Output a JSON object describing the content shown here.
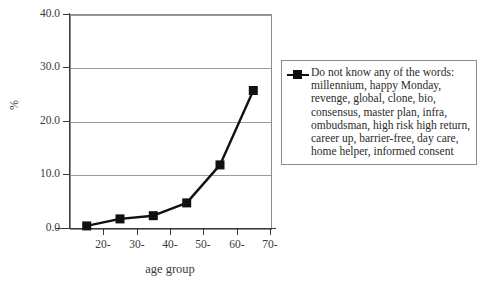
{
  "chart_data": {
    "type": "line",
    "title": "",
    "xlabel": "age group",
    "ylabel": "%",
    "xlim": [
      10,
      70
    ],
    "ylim": [
      0,
      40
    ],
    "grid": true,
    "legend_position": "right",
    "x_ticks": [
      "20-",
      "30-",
      "40-",
      "50-",
      "60-",
      "70-"
    ],
    "x_tick_values": [
      20,
      30,
      40,
      50,
      60,
      70
    ],
    "y_ticks": [
      "0.0",
      "10.0",
      "20.0",
      "30.0",
      "40.0"
    ],
    "y_tick_values": [
      0,
      10,
      20,
      30,
      40
    ],
    "series": [
      {
        "name": "Do not know any of the words: millennium, happy Monday, revenge, global, clone, bio, consensus, master plan, infra, ombudsman, high risk high return, career up, barrier-free, day care, home helper, informed consent",
        "marker": "square",
        "color": "#111111",
        "x": [
          15,
          25,
          35,
          45,
          55,
          65
        ],
        "values": [
          0.4,
          1.7,
          2.3,
          4.7,
          11.8,
          25.7
        ]
      }
    ]
  },
  "axes": {
    "y_title": "%",
    "x_title": "age group",
    "y_labels": [
      "40.0",
      "30.0",
      "20.0",
      "10.0",
      "0.0"
    ],
    "x_labels": [
      "20-",
      "30-",
      "40-",
      "50-",
      "60-",
      "70-"
    ]
  },
  "legend": {
    "lines": [
      "Do not know any of the words:",
      "millennium, happy Monday,",
      "revenge, global, clone, bio,",
      "consensus, master plan, infra,",
      "ombudsman, high risk high return,",
      "career up, barrier-free, day care,",
      "home helper, informed consent"
    ]
  },
  "colors": {
    "series": "#111111",
    "grid": "#9a9a9a",
    "frame": "#8c8c8c",
    "axis": "#3a3a3a",
    "text": "#2b2b2b",
    "background": "#ffffff"
  }
}
